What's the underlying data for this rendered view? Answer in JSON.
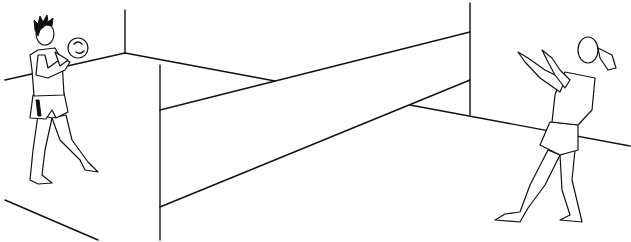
{
  "illustration": {
    "subject": "Two children playing volleyball over a net in a walled room",
    "colors": {
      "line": "#111111",
      "background": "#ffffff"
    },
    "elements": {
      "left_child": "boy holding ball",
      "right_child": "girl with ponytail, arms raised",
      "net": "net between two posts",
      "room": "walls and floor lines"
    }
  }
}
